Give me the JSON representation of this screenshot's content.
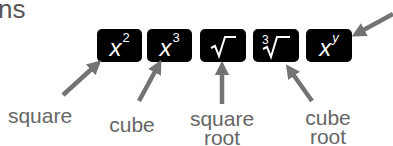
{
  "heading_fragment": "ns",
  "keys": [
    {
      "id": "square",
      "base": "x",
      "sup": "2"
    },
    {
      "id": "cube",
      "base": "x",
      "sup": "3"
    },
    {
      "id": "square-root",
      "symbol": "√"
    },
    {
      "id": "cube-root",
      "index": "3",
      "symbol": "√"
    },
    {
      "id": "power",
      "base": "x",
      "sup": "y"
    }
  ],
  "labels": {
    "square": "square",
    "cube": "cube",
    "square_root": [
      "square",
      "root"
    ],
    "cube_root": [
      "cube",
      "root"
    ]
  },
  "colors": {
    "key_bg": "#000000",
    "key_text": "#ffffff",
    "arrow": "#737373",
    "label": "#666666"
  }
}
